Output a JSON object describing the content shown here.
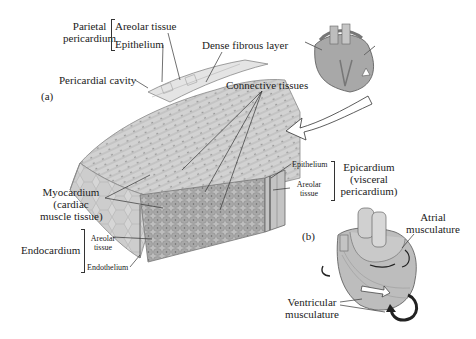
{
  "figure": {
    "panel_a": {
      "marker": "(a)",
      "labels": {
        "parietal_pericardium": [
          "Parietal",
          "pericardium"
        ],
        "parietal_layers": [
          "Areolar tissue",
          "Epithelium"
        ],
        "dense_fibrous_layer": "Dense fibrous layer",
        "pericardial_cavity": "Pericardial cavity",
        "connective_tissues": "Connective tissues",
        "myocardium": [
          "Myocardium",
          "(cardiac",
          "muscle tissue)"
        ],
        "endocardium": "Endocardium",
        "endocardium_layers": [
          "Areolar",
          "tissue",
          "Endothelium"
        ],
        "epicardium_layers": [
          "Epithelium",
          "Areolar",
          "tissue"
        ],
        "epicardium": [
          "Epicardium",
          "(visceral",
          "pericardium)"
        ]
      }
    },
    "panel_b": {
      "marker": "(b)",
      "labels": {
        "atrial": [
          "Atrial",
          "musculature"
        ],
        "ventricular": [
          "Ventricular",
          "musculature"
        ]
      }
    },
    "colors": {
      "tissue_light": "#d9d9d9",
      "tissue_mid": "#b5b5b5",
      "tissue_dark": "#8a8a8a",
      "line": "#333333"
    }
  }
}
